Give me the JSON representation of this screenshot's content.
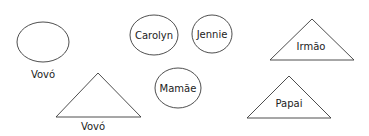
{
  "diagram": {
    "title": "",
    "nodes": [
      {
        "id": "vovo-ellipse",
        "shape": "ellipse",
        "label": "Vovó",
        "label_position": "below"
      },
      {
        "id": "carolyn",
        "shape": "ellipse",
        "label": "Carolyn",
        "label_position": "inside"
      },
      {
        "id": "jennie",
        "shape": "ellipse",
        "label": "Jennie",
        "label_position": "inside"
      },
      {
        "id": "irmao",
        "shape": "triangle",
        "label": "Irmão",
        "label_position": "inside"
      },
      {
        "id": "vovo-triangle",
        "shape": "triangle",
        "label": "Vovó",
        "label_position": "below"
      },
      {
        "id": "mamae",
        "shape": "ellipse",
        "label": "Mamãe",
        "label_position": "inside"
      },
      {
        "id": "papai",
        "shape": "triangle",
        "label": "Papai",
        "label_position": "inside"
      }
    ],
    "colors": {
      "stroke": "#3a3a3a",
      "text": "#222222",
      "background": "#ffffff"
    }
  }
}
